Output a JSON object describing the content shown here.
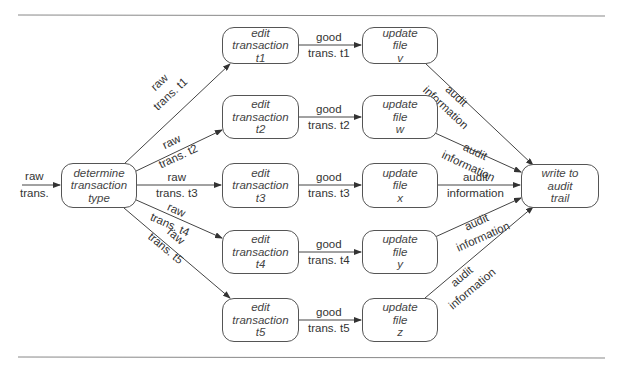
{
  "input": {
    "line1": "raw",
    "line2": "trans."
  },
  "determine": {
    "line1": "determine",
    "line2": "transaction",
    "line3": "type"
  },
  "write": {
    "line1": "write to",
    "line2": "audit",
    "line3": "trail"
  },
  "rows": [
    {
      "edit": [
        "edit",
        "transaction",
        "t1"
      ],
      "update": [
        "update",
        "file",
        "v"
      ],
      "raw": [
        "raw",
        "trans. t1"
      ],
      "good": [
        "good",
        "trans. t1"
      ],
      "audit": [
        "audit",
        "information"
      ]
    },
    {
      "edit": [
        "edit",
        "transaction",
        "t2"
      ],
      "update": [
        "update",
        "file",
        "w"
      ],
      "raw": [
        "raw",
        "trans. t2"
      ],
      "good": [
        "good",
        "trans. t2"
      ],
      "audit": [
        "audit",
        "information"
      ]
    },
    {
      "edit": [
        "edit",
        "transaction",
        "t3"
      ],
      "update": [
        "update",
        "file",
        "x"
      ],
      "raw": [
        "raw",
        "trans. t3"
      ],
      "good": [
        "good",
        "trans. t3"
      ],
      "audit": [
        "audit",
        "information"
      ]
    },
    {
      "edit": [
        "edit",
        "transaction",
        "t4"
      ],
      "update": [
        "update",
        "file",
        "y"
      ],
      "raw": [
        "raw",
        "trans. t4"
      ],
      "good": [
        "good",
        "trans. t4"
      ],
      "audit": [
        "audit",
        "information"
      ]
    },
    {
      "edit": [
        "edit",
        "transaction",
        "t5"
      ],
      "update": [
        "update",
        "file",
        "z"
      ],
      "raw": [
        "raw",
        "trans. t5"
      ],
      "good": [
        "good",
        "trans. t5"
      ],
      "audit": [
        "audit",
        "information"
      ]
    }
  ]
}
